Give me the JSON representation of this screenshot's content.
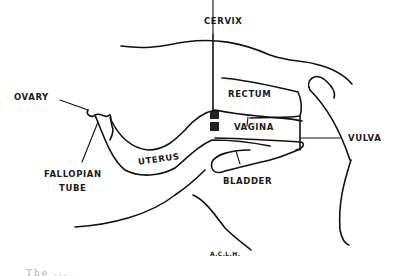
{
  "diagram": {
    "type": "anatomical-sagittal-section",
    "labels": {
      "cervix": "CERVIX",
      "ovary": "OVARY",
      "rectum": "RECTUM",
      "vagina": "VAGINA",
      "vulva": "VULVA",
      "uterus": "UTERUS",
      "fallopian_tube_line1": "FALLOPIAN",
      "fallopian_tube_line2": "TUBE",
      "bladder": "BLADDER"
    },
    "signature": "A.C.L.H.",
    "caption_fragment": "The ..."
  }
}
